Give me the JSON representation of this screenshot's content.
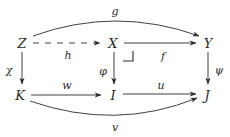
{
  "diagram": {
    "kind": "commutative-diagram",
    "ink_color": "#2b2b2b",
    "background_color": "#ffffff",
    "nodes": [
      {
        "id": "Z",
        "label": "Z",
        "x": 22,
        "y": 43
      },
      {
        "id": "X",
        "label": "X",
        "x": 113,
        "y": 43
      },
      {
        "id": "Y",
        "label": "Y",
        "x": 208,
        "y": 43
      },
      {
        "id": "K",
        "label": "K",
        "x": 20,
        "y": 95
      },
      {
        "id": "I",
        "label": "I",
        "x": 113,
        "y": 95
      },
      {
        "id": "J",
        "label": "J",
        "x": 207,
        "y": 95
      }
    ],
    "edges": [
      {
        "id": "g",
        "label": "g",
        "from": "Z",
        "to": "Y",
        "style": "solid",
        "shape": "curve-up",
        "label_x": 115,
        "label_y": 11
      },
      {
        "id": "h",
        "label": "h",
        "from": "Z",
        "to": "X",
        "style": "dashed",
        "shape": "straight",
        "label_x": 68,
        "label_y": 55
      },
      {
        "id": "f",
        "label": "f",
        "from": "X",
        "to": "Y",
        "style": "solid",
        "shape": "straight",
        "label_x": 163,
        "label_y": 56
      },
      {
        "id": "chi",
        "label": "χ",
        "from": "Z",
        "to": "K",
        "style": "solid",
        "shape": "straight",
        "label_x": 9,
        "label_y": 70
      },
      {
        "id": "phi",
        "label": "φ",
        "from": "X",
        "to": "I",
        "style": "solid",
        "shape": "straight",
        "label_x": 103,
        "label_y": 71
      },
      {
        "id": "psi",
        "label": "ψ",
        "from": "Y",
        "to": "J",
        "style": "solid",
        "shape": "straight",
        "label_x": 219,
        "label_y": 70
      },
      {
        "id": "w",
        "label": "w",
        "from": "K",
        "to": "I",
        "style": "solid",
        "shape": "straight",
        "label_x": 67,
        "label_y": 85
      },
      {
        "id": "u",
        "label": "u",
        "from": "I",
        "to": "J",
        "style": "solid",
        "shape": "straight",
        "label_x": 161,
        "label_y": 85
      },
      {
        "id": "v",
        "label": "v",
        "from": "K",
        "to": "J",
        "style": "solid",
        "shape": "curve-down",
        "label_x": 115,
        "label_y": 127
      }
    ],
    "markers": [
      {
        "id": "pullback-corner",
        "type": "pullback-square-marker",
        "x": 133,
        "y": 52,
        "size": 11
      }
    ]
  }
}
